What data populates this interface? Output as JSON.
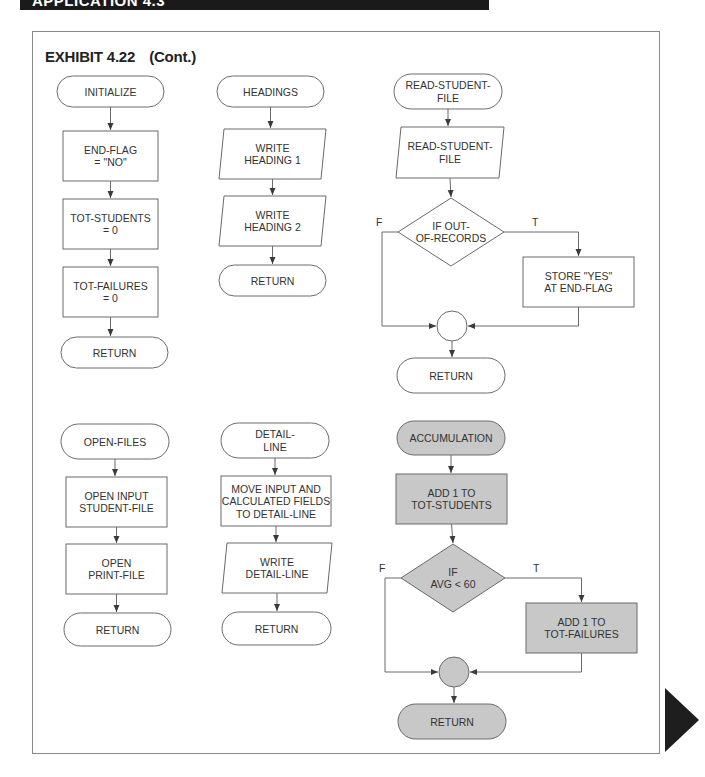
{
  "banner": {
    "text": "APPLICATION 4.3"
  },
  "exhibit": {
    "label": "EXHIBIT 4.22",
    "suffix": "(Cont.)"
  },
  "colors": {
    "stroke": "#6a6a6a",
    "text": "#333333",
    "highlight_fill": "#c8c8c8",
    "plain_fill": "#ffffff",
    "arrow": "#1e1e1e"
  },
  "modules": [
    {
      "name": "INITIALIZE",
      "highlighted": false,
      "nodes": [
        {
          "id": "init-start",
          "type": "terminal",
          "lines": [
            "INITIALIZE"
          ],
          "x": 57,
          "y": 76,
          "w": 107,
          "h": 31
        },
        {
          "id": "init-endflag",
          "type": "process",
          "lines": [
            "END-FLAG",
            "= \"NO\""
          ],
          "x": 63,
          "y": 131,
          "w": 95,
          "h": 50
        },
        {
          "id": "init-totstudents",
          "type": "process",
          "lines": [
            "TOT-STUDENTS",
            "= 0"
          ],
          "x": 63,
          "y": 199,
          "w": 95,
          "h": 50
        },
        {
          "id": "init-totfailures",
          "type": "process",
          "lines": [
            "TOT-FAILURES",
            "= 0"
          ],
          "x": 63,
          "y": 267,
          "w": 95,
          "h": 50
        },
        {
          "id": "init-return",
          "type": "terminal",
          "lines": [
            "RETURN"
          ],
          "x": 61,
          "y": 337,
          "w": 107,
          "h": 31
        }
      ]
    },
    {
      "name": "HEADINGS",
      "highlighted": false,
      "nodes": [
        {
          "id": "head-start",
          "type": "terminal",
          "lines": [
            "HEADINGS"
          ],
          "x": 217,
          "y": 76,
          "w": 107,
          "h": 31
        },
        {
          "id": "head-write1",
          "type": "io",
          "lines": [
            "WRITE",
            "HEADING 1"
          ],
          "x": 219,
          "y": 129,
          "w": 107,
          "h": 50
        },
        {
          "id": "head-write2",
          "type": "io",
          "lines": [
            "WRITE",
            "HEADING 2"
          ],
          "x": 219,
          "y": 196,
          "w": 107,
          "h": 50
        },
        {
          "id": "head-return",
          "type": "terminal",
          "lines": [
            "RETURN"
          ],
          "x": 219,
          "y": 265,
          "w": 107,
          "h": 31
        }
      ]
    },
    {
      "name": "READ-STUDENT-FILE",
      "highlighted": false,
      "nodes": [
        {
          "id": "read-start",
          "type": "terminal",
          "lines": [
            "READ-STUDENT-",
            "FILE"
          ],
          "x": 394,
          "y": 74,
          "w": 108,
          "h": 35
        },
        {
          "id": "read-io",
          "type": "io",
          "lines": [
            "READ-STUDENT-",
            "FILE"
          ],
          "x": 396,
          "y": 127,
          "w": 108,
          "h": 51
        },
        {
          "id": "read-decision",
          "type": "decision",
          "lines": [
            "IF OUT-",
            "OF-RECORDS"
          ],
          "cx": 451,
          "cy": 232,
          "hw": 53,
          "hh": 34
        },
        {
          "id": "read-store",
          "type": "process",
          "lines": [
            "STORE \"YES\"",
            "AT END-FLAG"
          ],
          "x": 523,
          "y": 257,
          "w": 111,
          "h": 50
        },
        {
          "id": "read-connector",
          "type": "connector",
          "cx": 452,
          "cy": 326,
          "r": 15
        },
        {
          "id": "read-return",
          "type": "terminal",
          "lines": [
            "RETURN"
          ],
          "x": 397,
          "y": 358,
          "w": 108,
          "h": 35
        }
      ],
      "labels": {
        "false": "F",
        "true": "T"
      }
    },
    {
      "name": "OPEN-FILES",
      "highlighted": false,
      "nodes": [
        {
          "id": "open-start",
          "type": "terminal",
          "lines": [
            "OPEN-FILES"
          ],
          "x": 61,
          "y": 424,
          "w": 108,
          "h": 35
        },
        {
          "id": "open-input",
          "type": "process",
          "lines": [
            "OPEN INPUT",
            "STUDENT-FILE"
          ],
          "x": 66,
          "y": 477,
          "w": 101,
          "h": 50
        },
        {
          "id": "open-print",
          "type": "process",
          "lines": [
            "OPEN",
            "PRINT-FILE"
          ],
          "x": 66,
          "y": 544,
          "w": 101,
          "h": 50
        },
        {
          "id": "open-return",
          "type": "terminal",
          "lines": [
            "RETURN"
          ],
          "x": 64,
          "y": 613,
          "w": 107,
          "h": 33
        }
      ]
    },
    {
      "name": "DETAIL-LINE",
      "highlighted": false,
      "nodes": [
        {
          "id": "detail-start",
          "type": "terminal",
          "lines": [
            "DETAIL-",
            "LINE"
          ],
          "x": 221,
          "y": 423,
          "w": 108,
          "h": 35
        },
        {
          "id": "detail-move",
          "type": "process",
          "lines": [
            "MOVE INPUT AND",
            "CALCULATED FIELDS",
            "TO DETAIL-LINE"
          ],
          "x": 221,
          "y": 476,
          "w": 110,
          "h": 50
        },
        {
          "id": "detail-write",
          "type": "io",
          "lines": [
            "WRITE",
            "DETAIL-LINE"
          ],
          "x": 222,
          "y": 543,
          "w": 110,
          "h": 50
        },
        {
          "id": "detail-return",
          "type": "terminal",
          "lines": [
            "RETURN"
          ],
          "x": 222,
          "y": 612,
          "w": 109,
          "h": 33
        }
      ]
    },
    {
      "name": "ACCUMULATION",
      "highlighted": true,
      "nodes": [
        {
          "id": "acc-start",
          "type": "terminal",
          "lines": [
            "ACCUMULATION"
          ],
          "x": 397,
          "y": 421,
          "w": 108,
          "h": 34
        },
        {
          "id": "acc-add-students",
          "type": "process",
          "lines": [
            "ADD 1 TO",
            "TOT-STUDENTS"
          ],
          "x": 396,
          "y": 474,
          "w": 111,
          "h": 50
        },
        {
          "id": "acc-decision",
          "type": "decision",
          "lines": [
            "IF",
            "AVG < 60"
          ],
          "cx": 453,
          "cy": 578,
          "hw": 52,
          "hh": 34
        },
        {
          "id": "acc-add-failures",
          "type": "process",
          "lines": [
            "ADD 1 TO",
            "TOT-FAILURES"
          ],
          "x": 526,
          "y": 603,
          "w": 111,
          "h": 50
        },
        {
          "id": "acc-connector",
          "type": "connector",
          "cx": 454,
          "cy": 672,
          "r": 15
        },
        {
          "id": "acc-return",
          "type": "terminal",
          "lines": [
            "RETURN"
          ],
          "x": 398,
          "y": 704,
          "w": 108,
          "h": 35
        }
      ],
      "labels": {
        "false": "F",
        "true": "T"
      }
    }
  ]
}
